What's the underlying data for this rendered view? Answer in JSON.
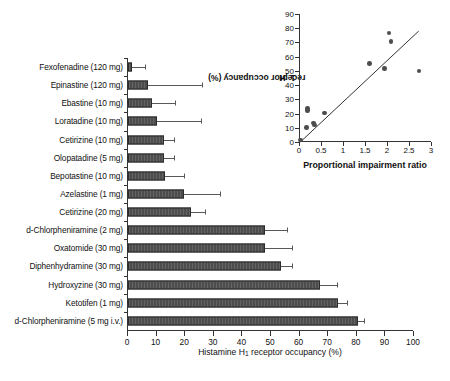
{
  "chart_data": [
    {
      "type": "bar",
      "orientation": "horizontal",
      "title": "",
      "xlabel": "Histamine H1 receptor occupancy (%)",
      "ylabel": "",
      "xlim": [
        0,
        100
      ],
      "xticks": [
        0,
        10,
        20,
        30,
        40,
        50,
        60,
        70,
        80,
        90,
        100
      ],
      "grid": false,
      "legend": "none",
      "bar_color": "#4d4d4d",
      "categories": [
        "Fexofenadine (120 mg)",
        "Epinastine (120 mg)",
        "Ebastine (10 mg)",
        "Loratadine (10 mg)",
        "Cetirizine (10 mg)",
        "Olopatadine (5 mg)",
        "Bepotastine (10 mg)",
        "Azelastine (1 mg)",
        "Cetirizine (20 mg)",
        "d-Chlorpheniramine (2 mg)",
        "Oxatomide (30 mg)",
        "Diphenhydramine (30 mg)",
        "Hydroxyzine (30 mg)",
        "Ketotifen (1 mg)",
        "d-Chlorpheniramine (5 mg i.v.)"
      ],
      "values": [
        1.5,
        7,
        8.5,
        10,
        12.5,
        12.5,
        13,
        19.5,
        22,
        48,
        48,
        53.5,
        67,
        73.5,
        80.5
      ],
      "errors_upper": [
        6,
        26,
        16.5,
        25.5,
        16,
        16,
        19.5,
        32,
        27,
        55.5,
        57.5,
        57.5,
        73,
        76.5,
        82.5
      ]
    },
    {
      "type": "scatter",
      "title": "",
      "xlabel": "Proportional impairment ratio",
      "ylabel": "H1 receptor occupancy (%)",
      "xlim": [
        0,
        3
      ],
      "ylim": [
        0,
        90
      ],
      "xticks": [
        0,
        0.5,
        1,
        1.5,
        2,
        2.5,
        3
      ],
      "xticklabels": [
        "0",
        "0.5",
        "1",
        "1.5",
        "2",
        "2.5",
        "3"
      ],
      "yticks": [
        0,
        10,
        20,
        30,
        40,
        50,
        60,
        70,
        80,
        90
      ],
      "grid": false,
      "legend": "none",
      "marker_color": "#4d4d4d",
      "points": [
        {
          "x": 0.03,
          "y": 1.5
        },
        {
          "x": 0.17,
          "y": 10.0
        },
        {
          "x": 0.19,
          "y": 23.5
        },
        {
          "x": 0.19,
          "y": 22.0
        },
        {
          "x": 0.33,
          "y": 13.5
        },
        {
          "x": 0.35,
          "y": 12.0
        },
        {
          "x": 0.58,
          "y": 20.5
        },
        {
          "x": 1.6,
          "y": 55.0
        },
        {
          "x": 1.94,
          "y": 51.5
        },
        {
          "x": 2.05,
          "y": 76.5
        },
        {
          "x": 2.09,
          "y": 70.5
        },
        {
          "x": 2.73,
          "y": 50.0
        }
      ],
      "trendline": {
        "x0": 0.03,
        "y0": 0.0,
        "x1": 2.72,
        "y1": 78.0
      }
    }
  ],
  "main_chart": {
    "x_axis": {
      "title_prefix": "Histamine H",
      "title_subscript": "1",
      "title_suffix": " receptor occupancy (%)",
      "tick_labels": [
        "0",
        "10",
        "20",
        "30",
        "40",
        "50",
        "60",
        "70",
        "80",
        "90",
        "100"
      ]
    },
    "bars": [
      {
        "label": "Fexofenadine (120 mg)",
        "value": 1.5,
        "error_upper": 6.0
      },
      {
        "label": "Epinastine (120 mg)",
        "value": 7.0,
        "error_upper": 26.0
      },
      {
        "label": "Ebastine (10 mg)",
        "value": 8.5,
        "error_upper": 16.5
      },
      {
        "label": "Loratadine (10 mg)",
        "value": 10.0,
        "error_upper": 25.5
      },
      {
        "label": "Cetirizine (10 mg)",
        "value": 12.5,
        "error_upper": 16.0
      },
      {
        "label": "Olopatadine (5 mg)",
        "value": 12.5,
        "error_upper": 16.0
      },
      {
        "label": "Bepotastine (10 mg)",
        "value": 13.0,
        "error_upper": 19.5
      },
      {
        "label": "Azelastine (1 mg)",
        "value": 19.5,
        "error_upper": 32.0
      },
      {
        "label": "Cetirizine (20 mg)",
        "value": 22.0,
        "error_upper": 27.0
      },
      {
        "label": "d-Chlorpheniramine (2 mg)",
        "value": 48.0,
        "error_upper": 55.5
      },
      {
        "label": "Oxatomide (30 mg)",
        "value": 48.0,
        "error_upper": 57.5
      },
      {
        "label": "Diphenhydramine (30 mg)",
        "value": 53.5,
        "error_upper": 57.5
      },
      {
        "label": "Hydroxyzine (30 mg)",
        "value": 67.0,
        "error_upper": 73.0
      },
      {
        "label": "Ketotifen (1 mg)",
        "value": 73.5,
        "error_upper": 76.5
      },
      {
        "label": "d-Chlorpheniramine (5 mg i.v.)",
        "value": 80.5,
        "error_upper": 82.5
      }
    ]
  },
  "inset_chart": {
    "x_axis": {
      "title": "Proportional impairment ratio",
      "tick_labels": [
        "0",
        "0.5",
        "1",
        "1.5",
        "2",
        "2.5",
        "3"
      ]
    },
    "y_axis": {
      "title_prefix": "H",
      "title_subscript": "1",
      "title_suffix": " receptor occupancy (%)",
      "tick_labels": [
        "0",
        "10",
        "20",
        "30",
        "40",
        "50",
        "60",
        "70",
        "80",
        "90"
      ]
    }
  }
}
